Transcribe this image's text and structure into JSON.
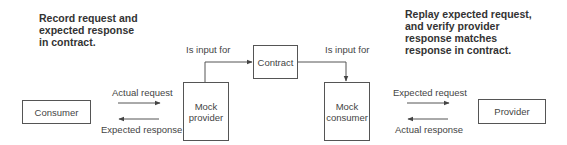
{
  "notes": {
    "left": "Record request and expected response in contract.",
    "right": "Replay expected request, and verify provider response matches response in contract."
  },
  "boxes": {
    "consumer": "Consumer",
    "mock_provider": "Mock provider",
    "contract": "Contract",
    "mock_consumer": "Mock consumer",
    "provider": "Provider"
  },
  "edges": {
    "mock_provider_to_contract": "Is input for",
    "contract_to_mock_consumer": "Is input for",
    "actual_request": "Actual request",
    "expected_response": "Expected response",
    "expected_request": "Expected request",
    "actual_response": "Actual response"
  }
}
